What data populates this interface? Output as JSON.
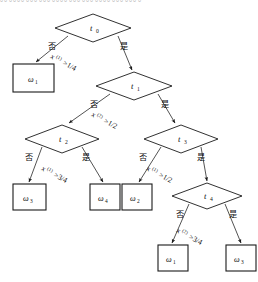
{
  "figure": {
    "type": "decision-tree",
    "top_cut_text": "。。。。。。。。。。。。。。。。。。。。。。。。。。。。。。。。。",
    "branch_labels": {
      "no": "否",
      "yes": "是"
    },
    "operator": ">"
  },
  "nodes": [
    {
      "id": "t0",
      "shape": "diamond",
      "label": "t",
      "sub": "0",
      "cx": 93,
      "cy": 28,
      "rx": 38,
      "ry": 14
    },
    {
      "id": "t1",
      "shape": "diamond",
      "label": "t",
      "sub": "1",
      "cx": 134,
      "cy": 86,
      "rx": 38,
      "ry": 14
    },
    {
      "id": "t2",
      "shape": "diamond",
      "label": "t",
      "sub": "2",
      "cx": 62,
      "cy": 139,
      "rx": 37,
      "ry": 14
    },
    {
      "id": "t3",
      "shape": "diamond",
      "label": "t",
      "sub": "3",
      "cx": 181,
      "cy": 139,
      "rx": 37,
      "ry": 14
    },
    {
      "id": "t4",
      "shape": "diamond",
      "label": "t",
      "sub": "4",
      "cx": 207,
      "cy": 196,
      "rx": 35,
      "ry": 13
    }
  ],
  "leaves": [
    {
      "id": "L1",
      "label": "ω",
      "sub": "1",
      "x": 13,
      "y": 64,
      "w": 41,
      "h": 28
    },
    {
      "id": "L2",
      "label": "ω",
      "sub": "3",
      "x": 13,
      "y": 184,
      "w": 33,
      "h": 26
    },
    {
      "id": "L3",
      "label": "ω",
      "sub": "4",
      "x": 90,
      "y": 184,
      "w": 30,
      "h": 26
    },
    {
      "id": "L4",
      "label": "ω",
      "sub": "2",
      "x": 122,
      "y": 184,
      "w": 30,
      "h": 26
    },
    {
      "id": "L5",
      "label": "ω",
      "sub": "1",
      "x": 158,
      "y": 245,
      "w": 30,
      "h": 26
    },
    {
      "id": "L6",
      "label": "ω",
      "sub": "3",
      "x": 226,
      "y": 245,
      "w": 30,
      "h": 26
    }
  ],
  "splits": [
    {
      "node": "t0",
      "var": "x",
      "sup": "(1)",
      "op": ">",
      "value": "1/4",
      "text": "x(1)>1/4"
    },
    {
      "node": "t1",
      "var": "x",
      "sup": "(2)",
      "op": ">",
      "value": "1/2",
      "text": "x(2)>1/2"
    },
    {
      "node": "t2",
      "var": "x",
      "sup": "(1)",
      "op": ">",
      "value": "3/4",
      "text": "x(1)>3/4"
    },
    {
      "node": "t3",
      "var": "x",
      "sup": "(1)",
      "op": ">",
      "value": "1/2",
      "text": "x(1)>1/2"
    },
    {
      "node": "t4",
      "var": "x",
      "sup": "(2)",
      "op": ">",
      "value": "3/4",
      "text": "x(2)>3/4"
    }
  ],
  "labels": {
    "t0_label": "t",
    "t0_sub": "0",
    "t1_label": "t",
    "t1_sub": "1",
    "t2_label": "t",
    "t2_sub": "2",
    "t3_label": "t",
    "t3_sub": "3",
    "t4_label": "t",
    "t4_sub": "4",
    "l1_label": "ω",
    "l1_sub": "1",
    "l2_label": "ω",
    "l2_sub": "3",
    "l3_label": "ω",
    "l3_sub": "4",
    "l4_label": "ω",
    "l4_sub": "2",
    "l5_label": "ω",
    "l5_sub": "1",
    "l6_label": "ω",
    "l6_sub": "3",
    "no": "否",
    "yes": "是",
    "c0_var": "x",
    "c0_sup": "(1)",
    "c0_rest": ">1/4",
    "c1_var": "x",
    "c1_sup": "(2)",
    "c1_rest": ">1/2",
    "c2_var": "x",
    "c2_sup": "(1)",
    "c2_rest": ">3/4",
    "c3_var": "x",
    "c3_sup": "(1)",
    "c3_rest": ">1/2",
    "c4_var": "x",
    "c4_sup": "(2)",
    "c4_rest": ">3/4"
  }
}
